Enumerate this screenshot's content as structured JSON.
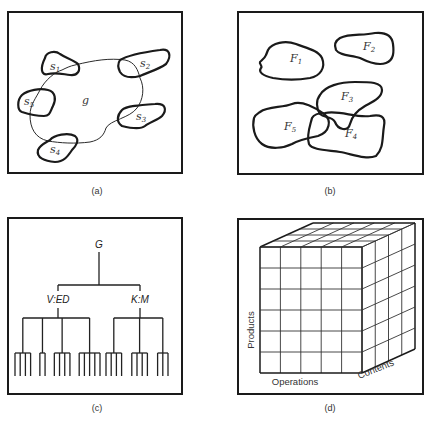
{
  "panels": {
    "a": {
      "caption": "(a)",
      "center_label": "g",
      "satellites": [
        {
          "base": "s",
          "sub": "1"
        },
        {
          "base": "s",
          "sub": "2"
        },
        {
          "base": "s",
          "sub": "3"
        },
        {
          "base": "s",
          "sub": "4"
        },
        {
          "base": "s",
          "sub": "5"
        }
      ]
    },
    "b": {
      "caption": "(b)",
      "regions": [
        {
          "base": "F",
          "sub": "1"
        },
        {
          "base": "F",
          "sub": "2"
        },
        {
          "base": "F",
          "sub": "3"
        },
        {
          "base": "F",
          "sub": "4"
        },
        {
          "base": "F",
          "sub": "5"
        }
      ]
    },
    "c": {
      "caption": "(c)",
      "root": "G",
      "children": [
        {
          "label": "V:ED",
          "leaf_groups": [
            4,
            2,
            4,
            5
          ]
        },
        {
          "label": "K:M",
          "leaf_groups": [
            4,
            4,
            3
          ]
        }
      ]
    },
    "d": {
      "caption": "(d)",
      "axes": {
        "vertical": "Products",
        "horizontal": "Operations",
        "depth": "Contents"
      },
      "grid": {
        "front_columns": 5,
        "front_rows": 6,
        "depth_cells": 4
      }
    }
  }
}
